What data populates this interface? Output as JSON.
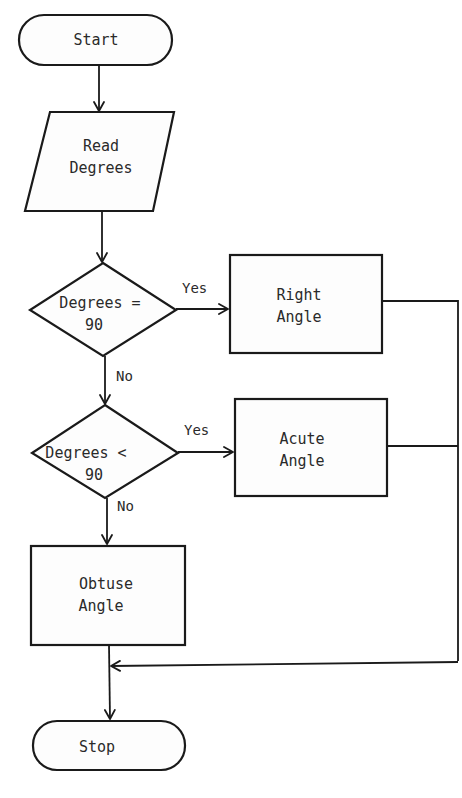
{
  "diagram": {
    "type": "flowchart",
    "nodes": {
      "start": {
        "shape": "terminator",
        "text": "Start"
      },
      "read": {
        "shape": "parallelogram",
        "line1": "Read",
        "line2": "Degrees"
      },
      "decision1": {
        "shape": "diamond",
        "line1": "Degrees =",
        "line2": "90"
      },
      "right": {
        "shape": "process",
        "line1": "Right",
        "line2": "Angle"
      },
      "decision2": {
        "shape": "diamond",
        "line1": "Degrees <",
        "line2": "90"
      },
      "acute": {
        "shape": "process",
        "line1": "Acute",
        "line2": "Angle"
      },
      "obtuse": {
        "shape": "process",
        "line1": "Obtuse",
        "line2": "Angle"
      },
      "stop": {
        "shape": "terminator",
        "text": "Stop"
      }
    },
    "edges": {
      "d1_yes": "Yes",
      "d1_no": "No",
      "d2_yes": "Yes",
      "d2_no": "No"
    },
    "colors": {
      "stroke": "#1a1a1a",
      "background": "#ffffff"
    }
  }
}
